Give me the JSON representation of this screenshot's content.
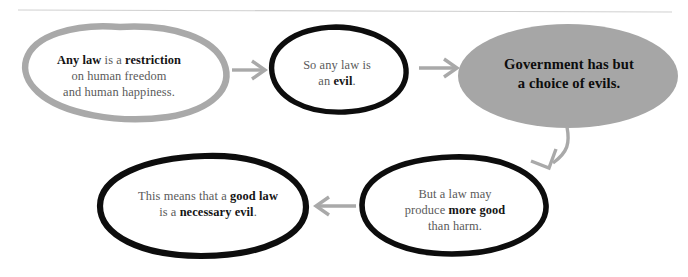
{
  "diagram": {
    "divider": {
      "name": "top-rule",
      "color": "#d0d0d0"
    },
    "palette": {
      "gray_stroke": "#a9a9a9",
      "black_stroke": "#0d0d0d",
      "gray_fill": "#a6a6a6",
      "arrow_gray": "#a9a9a9",
      "body_text": "#5a5a5a",
      "bold_text": "#141414",
      "background": "#ffffff"
    },
    "nodes": [
      {
        "id": "n1",
        "name": "node-any-law-restriction",
        "style": "gray-outline",
        "lines": [
          {
            "segments": [
              {
                "text": "Any law",
                "bold": true
              },
              {
                "text": " is a ",
                "bold": false
              },
              {
                "text": "restriction",
                "bold": true
              }
            ]
          },
          {
            "segments": [
              {
                "text": "on human freedom",
                "bold": false
              }
            ]
          },
          {
            "segments": [
              {
                "text": "and human happiness.",
                "bold": false
              }
            ]
          }
        ],
        "plain_text": "Any law is a restriction on human freedom and human happiness."
      },
      {
        "id": "n2",
        "name": "node-so-any-law-is-an-evil",
        "style": "black-outline",
        "lines": [
          {
            "segments": [
              {
                "text": "So any law is",
                "bold": false
              }
            ]
          },
          {
            "segments": [
              {
                "text": "an ",
                "bold": false
              },
              {
                "text": "evil",
                "bold": true
              },
              {
                "text": ".",
                "bold": false
              }
            ]
          }
        ],
        "plain_text": "So any law is an evil."
      },
      {
        "id": "n3",
        "name": "node-government-choice-of-evils",
        "style": "gray-filled",
        "lines": [
          {
            "segments": [
              {
                "text": "Government has but",
                "bold": true
              }
            ]
          },
          {
            "segments": [
              {
                "text": "a choice of evils.",
                "bold": true
              }
            ]
          }
        ],
        "plain_text": "Government has but a choice of evils."
      },
      {
        "id": "n4",
        "name": "node-law-may-produce-more-good",
        "style": "black-outline",
        "lines": [
          {
            "segments": [
              {
                "text": "But a law may",
                "bold": false
              }
            ]
          },
          {
            "segments": [
              {
                "text": "produce ",
                "bold": false
              },
              {
                "text": "more good",
                "bold": true
              }
            ]
          },
          {
            "segments": [
              {
                "text": "than harm.",
                "bold": false
              }
            ]
          }
        ],
        "plain_text": "But a law may produce more good than harm."
      },
      {
        "id": "n5",
        "name": "node-good-law-necessary-evil",
        "style": "black-outline",
        "lines": [
          {
            "segments": [
              {
                "text": "This means that a ",
                "bold": false
              },
              {
                "text": "good law",
                "bold": true
              }
            ]
          },
          {
            "segments": [
              {
                "text": "is a ",
                "bold": false
              },
              {
                "text": "necessary evil",
                "bold": true
              },
              {
                "text": ".",
                "bold": false
              }
            ]
          }
        ],
        "plain_text": "This means that a good law is a necessary evil."
      }
    ],
    "connectors": [
      {
        "id": "a1",
        "name": "arrow-n1-to-n2",
        "from": "n1",
        "to": "n2",
        "direction": "right",
        "shape": "straight"
      },
      {
        "id": "a2",
        "name": "arrow-n2-to-n3",
        "from": "n2",
        "to": "n3",
        "direction": "right",
        "shape": "straight"
      },
      {
        "id": "a3",
        "name": "arrow-n3-to-n4",
        "from": "n3",
        "to": "n4",
        "direction": "down-left",
        "shape": "curved"
      },
      {
        "id": "a4",
        "name": "arrow-n4-to-n5",
        "from": "n4",
        "to": "n5",
        "direction": "left",
        "shape": "straight"
      }
    ]
  }
}
